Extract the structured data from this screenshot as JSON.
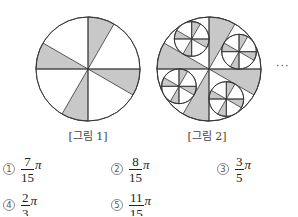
{
  "figures": [
    {
      "id": "fig1",
      "caption": "[그림 1]",
      "cx": 88,
      "cy": 69,
      "r": 52,
      "levels": 1,
      "caption_x": 88
    },
    {
      "id": "fig2",
      "caption": "[그림 2]",
      "cx": 209,
      "cy": 69,
      "r": 52,
      "levels": 2,
      "caption_x": 207
    }
  ],
  "pattern": {
    "shaded_sectors_deg": [
      [
        60,
        90
      ],
      [
        150,
        180
      ],
      [
        240,
        270
      ],
      [
        330,
        360
      ]
    ],
    "white_sector_centers_deg": [
      30,
      120,
      210,
      300
    ],
    "axes_deg": [
      0,
      90,
      180,
      270
    ],
    "shade_color": "#c8c8c8",
    "line_color": "#333333"
  },
  "ellipsis": "···",
  "options": [
    {
      "num": "1",
      "numerator": "7",
      "denominator": "15",
      "suffix": "π",
      "x": 2,
      "y": 154
    },
    {
      "num": "2",
      "numerator": "8",
      "denominator": "15",
      "suffix": "π",
      "x": 110,
      "y": 154
    },
    {
      "num": "3",
      "numerator": "3",
      "denominator": "5",
      "suffix": "π",
      "x": 216,
      "y": 154
    },
    {
      "num": "4",
      "numerator": "2",
      "denominator": "3",
      "suffix": "π",
      "x": 2,
      "y": 190
    },
    {
      "num": "5",
      "numerator": "11",
      "denominator": "15",
      "suffix": "π",
      "x": 110,
      "y": 190
    }
  ]
}
